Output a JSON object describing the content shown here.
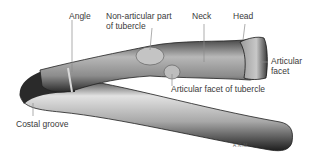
{
  "figure": {
    "labels": {
      "angle": "Angle",
      "non_articular_line1": "Non-articular part",
      "non_articular_line2": "of tubercle",
      "neck": "Neck",
      "head": "Head",
      "articular_facet_line1": "Articular",
      "articular_facet_line2": "facet",
      "articular_facet_tubercle": "Articular facet of tubercle",
      "costal_groove": "Costal groove"
    },
    "signature": "A.K.M.",
    "colors": {
      "background": "#ffffff",
      "bone_light": "#d8d8d8",
      "bone_mid": "#9a9a9a",
      "bone_dark": "#2a2a2a",
      "leader_line": "#8a8a8a",
      "text": "#3a3a3a"
    }
  }
}
